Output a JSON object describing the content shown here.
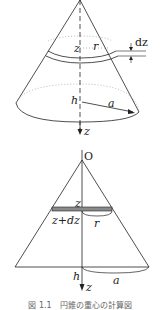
{
  "figure": {
    "top_diagram": {
      "description": "3D cone with thin ring slice",
      "labels": {
        "z": "z",
        "r": "r",
        "dz": "dz",
        "h": "h",
        "a": "a",
        "axis": "z"
      }
    },
    "bottom_diagram": {
      "description": "Cross-section of cone with disk slice",
      "labels": {
        "origin": "O",
        "z": "z",
        "z_plus_dz": "z+dz",
        "r": "r",
        "h": "h",
        "a": "a",
        "axis": "z"
      }
    },
    "caption": "図 1.1　円錐の重心の計算図"
  },
  "colors": {
    "line": "#222222",
    "slice_fill": "#8a8a8a",
    "dotted": "#999999",
    "background": "#ffffff"
  }
}
